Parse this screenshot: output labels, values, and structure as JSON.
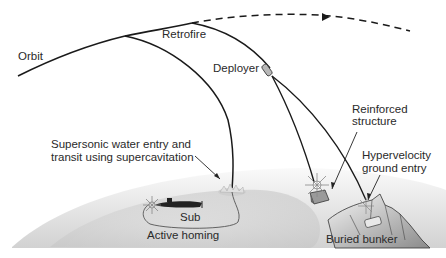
{
  "diagram": {
    "labels": {
      "orbit": "Orbit",
      "retrofire": "Retrofire",
      "deployer": "Deployer",
      "reinforced_line1": "Reinforced",
      "reinforced_line2": "structure",
      "supersonic_line1": "Supersonic water entry and",
      "supersonic_line2": "transit using supercavitation",
      "hypervelocity_line1": "Hypervelocity",
      "hypervelocity_line2": "ground entry",
      "sub": "Sub",
      "active_homing": "Active homing",
      "buried_bunker": "Buried bunker"
    },
    "elements": [
      "orbit-path",
      "retrofire-point",
      "dashed-continuation",
      "deployer-vehicle",
      "submarine",
      "reinforced-structure",
      "mountain-bunker",
      "earth-surface"
    ],
    "colors": {
      "line": "#1a1a1a",
      "earth_light": "#f2f2f2",
      "earth_dark": "#c8c8c8",
      "text": "#2a2a2a"
    }
  }
}
